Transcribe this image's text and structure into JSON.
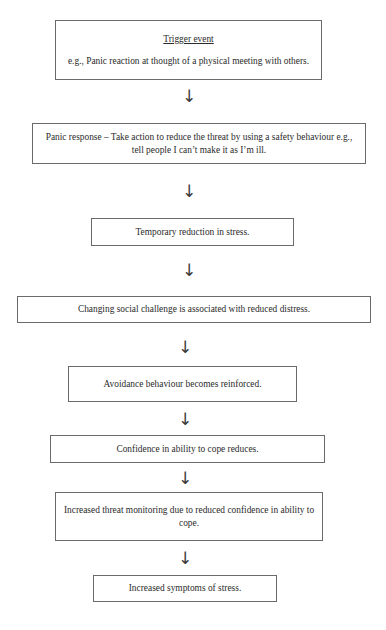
{
  "diagram": {
    "arrow_glyph": "↓",
    "nodes": [
      {
        "id": "trigger-event",
        "title": "Trigger event",
        "body": "e.g., Panic reaction at thought of a physical meeting with others.",
        "x": 55,
        "y": 20,
        "w": 267,
        "h": 60
      },
      {
        "id": "panic-response",
        "title": "",
        "body": "Panic response – Take action to reduce the threat by using a safety behaviour e.g., tell people I can’t make it as I’m ill.",
        "x": 32,
        "y": 123,
        "w": 334,
        "h": 41
      },
      {
        "id": "temporary-reduction",
        "title": "",
        "body": "Temporary reduction in stress.",
        "x": 91,
        "y": 218,
        "w": 203,
        "h": 28
      },
      {
        "id": "changing-social-challenge",
        "title": "",
        "body": "Changing social challenge is associated with reduced distress.",
        "x": 17,
        "y": 296,
        "w": 354,
        "h": 27
      },
      {
        "id": "avoidance-reinforced",
        "title": "",
        "body": "Avoidance behaviour becomes reinforced.",
        "x": 68,
        "y": 366,
        "w": 229,
        "h": 36
      },
      {
        "id": "confidence-reduces",
        "title": "",
        "body": "Confidence in ability to cope reduces.",
        "x": 50,
        "y": 435,
        "w": 275,
        "h": 28
      },
      {
        "id": "increased-threat-monitoring",
        "title": "",
        "body": "Increased threat monitoring due to reduced confidence in ability to cope.",
        "x": 55,
        "y": 492,
        "w": 268,
        "h": 49
      },
      {
        "id": "increased-symptoms",
        "title": "",
        "body": "Increased symptoms of stress.",
        "x": 93,
        "y": 575,
        "w": 184,
        "h": 27
      }
    ],
    "arrows": [
      {
        "id": "arrow-1",
        "from": "trigger-event",
        "to": "panic-response",
        "x": 179,
        "y": 88
      },
      {
        "id": "arrow-2",
        "from": "panic-response",
        "to": "temporary-reduction",
        "x": 179,
        "y": 183
      },
      {
        "id": "arrow-3",
        "from": "temporary-reduction",
        "to": "changing-social-challenge",
        "x": 179,
        "y": 262
      },
      {
        "id": "arrow-4",
        "from": "changing-social-challenge",
        "to": "avoidance-reinforced",
        "x": 175,
        "y": 339
      },
      {
        "id": "arrow-5",
        "from": "avoidance-reinforced",
        "to": "confidence-reduces",
        "x": 175,
        "y": 411
      },
      {
        "id": "arrow-6",
        "from": "confidence-reduces",
        "to": "increased-threat-monitoring",
        "x": 175,
        "y": 470
      },
      {
        "id": "arrow-7",
        "from": "increased-threat-monitoring",
        "to": "increased-symptoms",
        "x": 175,
        "y": 550
      }
    ]
  }
}
